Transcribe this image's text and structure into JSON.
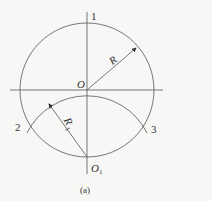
{
  "diagram": {
    "labels": {
      "point1": "1",
      "point2": "2",
      "point3": "3",
      "center": "O",
      "center2": "O",
      "center2_sub": "1",
      "radius": "R",
      "radius1": "R",
      "radius1_sub": "1",
      "caption": "(a)"
    },
    "colors": {
      "line": "#555555",
      "background": "#f7f7f5",
      "text": "#333333"
    }
  }
}
